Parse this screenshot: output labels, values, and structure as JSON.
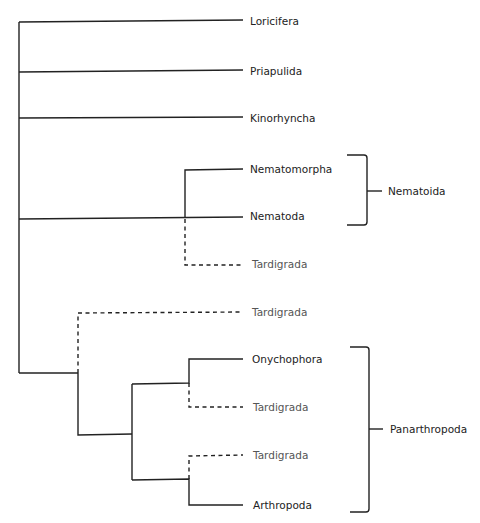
{
  "diagram": {
    "type": "phylogenetic-tree",
    "taxa": [
      {
        "id": "loricifera",
        "label": "Loricifera",
        "y": 22,
        "style": "solid"
      },
      {
        "id": "priapulida",
        "label": "Priapulida",
        "y": 72,
        "style": "solid"
      },
      {
        "id": "kinorhyncha",
        "label": "Kinorhyncha",
        "y": 118,
        "style": "solid"
      },
      {
        "id": "nematomorpha",
        "label": "Nematomorpha",
        "y": 170,
        "style": "solid"
      },
      {
        "id": "nematoda",
        "label": "Nematoda",
        "y": 218,
        "style": "solid"
      },
      {
        "id": "tardigrada-1",
        "label": "Tardigrada",
        "y": 265,
        "style": "dashed"
      },
      {
        "id": "tardigrada-2",
        "label": "Tardigrada",
        "y": 313,
        "style": "dashed"
      },
      {
        "id": "onychophora",
        "label": "Onychophora",
        "y": 359,
        "style": "solid"
      },
      {
        "id": "tardigrada-3",
        "label": "Tardigrada",
        "y": 407,
        "style": "dashed"
      },
      {
        "id": "tardigrada-4",
        "label": "Tardigrada",
        "y": 456,
        "style": "dashed"
      },
      {
        "id": "arthropoda",
        "label": "Arthropoda",
        "y": 505,
        "style": "solid"
      }
    ],
    "groups": [
      {
        "id": "nematoida",
        "label": "Nematoida",
        "members": [
          "Nematomorpha",
          "Nematoda"
        ]
      },
      {
        "id": "panarthropoda",
        "label": "Panarthropoda",
        "members": [
          "Onychophora",
          "Tardigrada",
          "Tardigrada",
          "Arthropoda"
        ]
      }
    ],
    "line_color": "#222222",
    "tardigrada_label_color": "#555555"
  }
}
